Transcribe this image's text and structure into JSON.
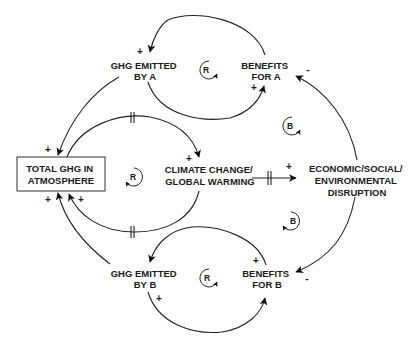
{
  "diagram": {
    "type": "causal-loop-diagram",
    "nodes": {
      "total_ghg": [
        "TOTAL GHG IN",
        "ATMOSPHERE"
      ],
      "climate": [
        "CLIMATE CHANGE/",
        "GLOBAL WARMING"
      ],
      "disruption": [
        "ECONOMIC/SOCIAL/",
        "ENVIRONMENTAL",
        "DISRUPTION"
      ],
      "ghg_a": [
        "GHG EMITTED",
        "BY A"
      ],
      "benefits_a": [
        "BENEFITS",
        "FOR A"
      ],
      "ghg_b": [
        "GHG EMITTED",
        "BY B"
      ],
      "benefits_b": [
        "BENEFITS",
        "FOR B"
      ]
    },
    "links": [
      {
        "from": "ghg_a",
        "to": "total_ghg",
        "polarity": "+"
      },
      {
        "from": "ghg_b",
        "to": "total_ghg",
        "polarity": "+"
      },
      {
        "from": "climate",
        "to": "total_ghg",
        "polarity": "+",
        "delay": true
      },
      {
        "from": "total_ghg",
        "to": "climate",
        "polarity": "+",
        "delay": true
      },
      {
        "from": "climate",
        "to": "disruption",
        "polarity": "+",
        "delay": true
      },
      {
        "from": "disruption",
        "to": "benefits_a",
        "polarity": "-"
      },
      {
        "from": "disruption",
        "to": "benefits_b",
        "polarity": "-"
      },
      {
        "from": "benefits_a",
        "to": "ghg_a",
        "polarity": "+"
      },
      {
        "from": "ghg_a",
        "to": "benefits_a",
        "polarity": "+"
      },
      {
        "from": "benefits_b",
        "to": "ghg_b",
        "polarity": "+"
      },
      {
        "from": "ghg_b",
        "to": "benefits_b",
        "polarity": "+"
      }
    ],
    "loops": {
      "top": "R",
      "center": "R",
      "bottom": "R",
      "upper_right": "B",
      "lower_right": "B"
    },
    "signs": {
      "plus": "+",
      "minus": "-"
    }
  }
}
